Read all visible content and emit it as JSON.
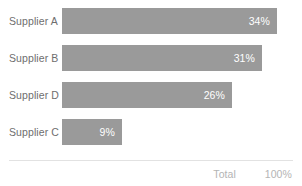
{
  "chart_data": {
    "type": "bar",
    "orientation": "horizontal",
    "title": "",
    "xlabel": "",
    "ylabel": "",
    "categories": [
      "Supplier A",
      "Supplier B",
      "Supplier D",
      "Supplier C"
    ],
    "values": [
      34,
      31,
      26,
      9
    ],
    "value_labels": [
      "34%",
      "31%",
      "26%",
      "9%"
    ],
    "xlim": [
      0,
      40
    ],
    "grid": false,
    "legend": false,
    "series": [
      {
        "name": "Share",
        "values": [
          34,
          31,
          26,
          9
        ]
      }
    ],
    "bar_color": "#9a9a9a",
    "value_text_color": "#ffffff",
    "category_text_color": "#6e6e6e"
  },
  "rows": [
    {
      "label": "Supplier A",
      "value_label": "34%",
      "width_px": 215
    },
    {
      "label": "Supplier B",
      "value_label": "31%",
      "width_px": 200
    },
    {
      "label": "Supplier D",
      "value_label": "26%",
      "width_px": 170
    },
    {
      "label": "Supplier C",
      "value_label": "9%",
      "width_px": 60
    }
  ],
  "footer": {
    "total_label": "Total",
    "total_value": "100%",
    "text_color": "#b4b4b4",
    "divider_color": "#e2e2e2"
  }
}
